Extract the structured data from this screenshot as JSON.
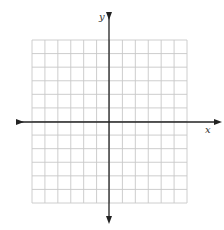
{
  "diagram": {
    "type": "coordinate-plane",
    "axes": {
      "x_label": "x",
      "y_label": "y",
      "arrows": [
        "left",
        "right",
        "up",
        "down"
      ]
    },
    "grid": {
      "columns": 12,
      "rows": 12,
      "columns_left_of_y_axis": 6,
      "columns_right_of_y_axis": 6,
      "rows_above_x_axis": 6,
      "rows_below_x_axis": 6,
      "tick_labels": "none"
    },
    "colors": {
      "grid_line": "#c8c8c8",
      "axis_line": "#222222",
      "background": "#ffffff"
    }
  }
}
